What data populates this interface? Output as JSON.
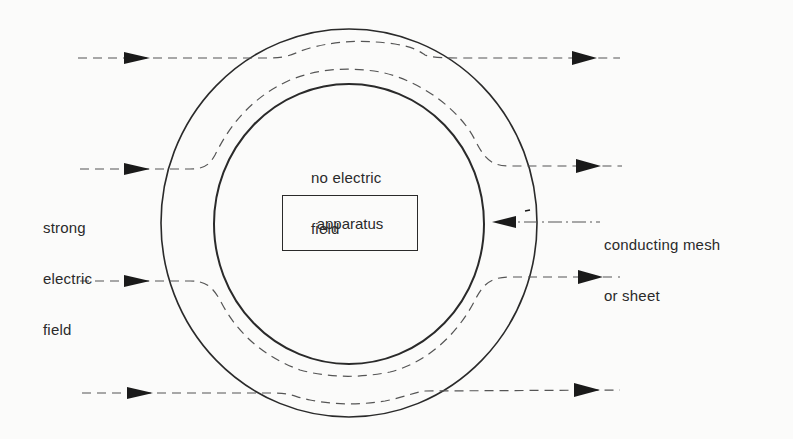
{
  "diagram": {
    "type": "electrostatic shielding (Faraday cage) schematic",
    "labels": {
      "inside": [
        "no electric",
        "field"
      ],
      "outside": [
        "strong",
        "electric",
        "field"
      ],
      "apparatus": "apparatus",
      "shield": [
        "conducting mesh",
        "or sheet"
      ]
    },
    "shapes": {
      "outer_circle": {
        "cx": 349,
        "cy": 223,
        "rx": 188,
        "ry": 194
      },
      "inner_circle": {
        "cx": 349,
        "cy": 223,
        "rx": 135,
        "ry": 140
      },
      "apparatus_box": {
        "x": 282,
        "y": 195,
        "w": 136,
        "h": 56
      }
    },
    "field_lines": [
      {
        "id": 1,
        "y": 58,
        "direction": "left-to-right",
        "deflects": "over top of shield"
      },
      {
        "id": 2,
        "y": 168,
        "direction": "left-to-right",
        "deflects": "around upper shield wall"
      },
      {
        "id": 3,
        "y": 280,
        "direction": "left-to-right",
        "deflects": "around lower shield wall"
      },
      {
        "id": 4,
        "y": 393,
        "direction": "left-to-right",
        "deflects": "under bottom of shield"
      }
    ],
    "colors": {
      "ink": "#2a2a2a",
      "dashed": "#555555",
      "background": "#fbfbfa"
    }
  }
}
